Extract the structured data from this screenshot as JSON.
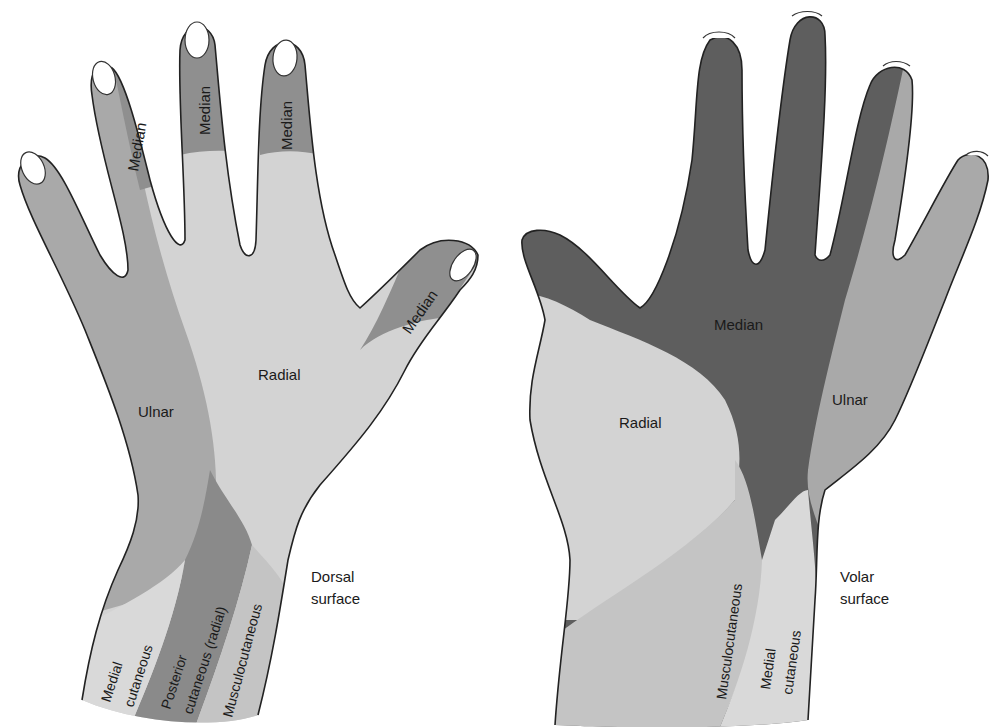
{
  "colors": {
    "background": "#ffffff",
    "median_dark": "#5e5e5e",
    "median_dorsal": "#8f8f8f",
    "ulnar": "#a9a9a9",
    "radial": "#d3d3d3",
    "posterior_cutaneous": "#8a8a8a",
    "musculocutaneous": "#c4c4c4",
    "medial_cutaneous": "#d9d9d9",
    "outline": "#222222"
  },
  "dorsal_hand": {
    "surface_label_line1": "Dorsal",
    "surface_label_line2": "surface",
    "labels": {
      "median_ring": "Median",
      "median_middle": "Median",
      "median_index": "Median",
      "median_thumb": "Median",
      "radial": "Radial",
      "ulnar": "Ulnar",
      "medial_cutaneous_1": "Medial",
      "medial_cutaneous_2": "cutaneous",
      "posterior_cutaneous_1": "Posterior",
      "posterior_cutaneous_2": "cutaneous (radial)",
      "musculocutaneous": "Musculocutaneous"
    }
  },
  "volar_hand": {
    "surface_label_line1": "Volar",
    "surface_label_line2": "surface",
    "labels": {
      "median": "Median",
      "radial": "Radial",
      "ulnar": "Ulnar",
      "musculocutaneous": "Musculocutaneous",
      "medial_cutaneous_1": "Medial",
      "medial_cutaneous_2": "cutaneous"
    }
  }
}
